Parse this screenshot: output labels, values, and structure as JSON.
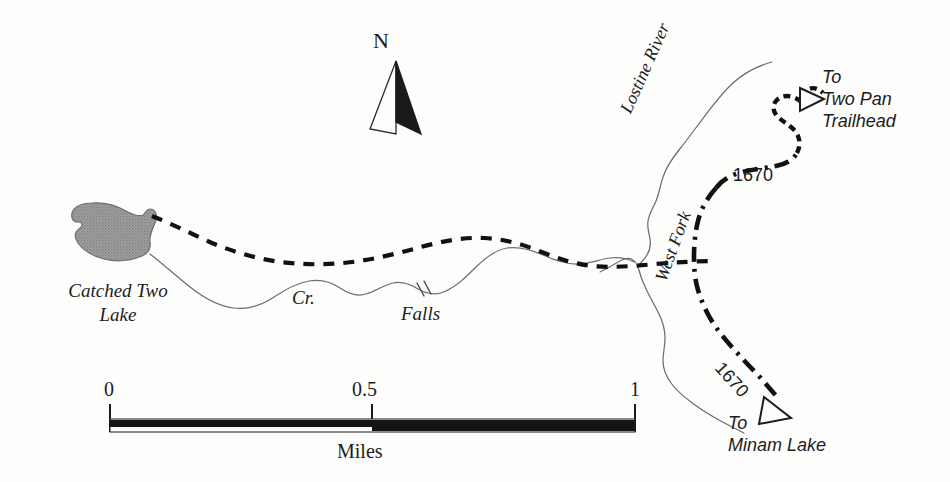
{
  "map": {
    "title": "Catched Two Lake trail map",
    "background_color": "#fdfdfc",
    "ink_color": "#1c1c1c",
    "water_line_color": "#6e6e6e",
    "lake_fill_color": "#9a9a9a",
    "features": {
      "lake_label": "Catched Two\nLake",
      "creek_label": "Cr.",
      "falls_label": "Falls",
      "river_label": "Lostine River",
      "fork_label": "West Fork"
    },
    "trails": {
      "number_north": "1670",
      "number_south": "1670"
    },
    "destinations": {
      "north": "To\nTwo Pan\nTrailhead",
      "south": "To\nMinam Lake"
    },
    "compass": {
      "letter": "N"
    },
    "scale": {
      "min": "0",
      "mid": "0.5",
      "max": "1",
      "units": "Miles"
    }
  }
}
